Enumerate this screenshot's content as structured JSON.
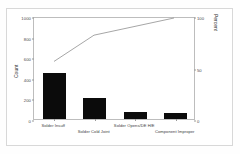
{
  "chart_data": {
    "type": "bar",
    "title": "",
    "subtitle": "",
    "xlabel": "",
    "ylabel": "Count",
    "y2label": "Percent",
    "categories": [
      "Solder Insuff",
      "Solder Cold Joint",
      "Solder Opens/DE H/E",
      "Component Improper"
    ],
    "values": [
      450,
      205,
      67,
      58
    ],
    "series": [
      {
        "name": "Count",
        "values": [
          450,
          205,
          67,
          58
        ]
      },
      {
        "name": "Cumulative Percent",
        "values": [
          57.0,
          83.0,
          91.5,
          100.0
        ]
      }
    ],
    "ylim": [
      0,
      1000
    ],
    "y2lim": [
      0,
      100
    ],
    "yticks": [
      "0",
      "200",
      "400",
      "600",
      "800",
      "1000"
    ],
    "ytick_values": [
      0,
      200,
      400,
      600,
      800,
      1000
    ],
    "y2ticks": [
      "0",
      "50",
      "100"
    ],
    "y2tick_values": [
      0,
      50,
      100
    ],
    "grid": false,
    "legend": "none",
    "bar_color": "#0b0b0b",
    "line_color": "#8d8d8d",
    "axis_color": "#bdbdbd",
    "frame_color": "#d8d8d8",
    "background": "#ffffff"
  }
}
